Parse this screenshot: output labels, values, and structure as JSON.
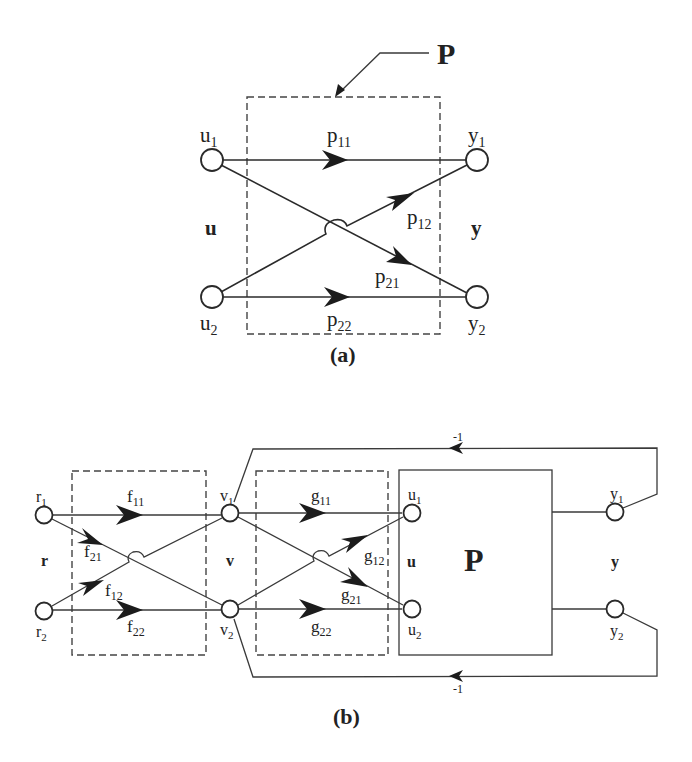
{
  "diagram_a": {
    "caption": "(a)",
    "block_label": "P",
    "inputs": [
      {
        "base": "u",
        "sub": "1"
      },
      {
        "base": "u",
        "sub": "2"
      }
    ],
    "outputs": [
      {
        "base": "y",
        "sub": "1"
      },
      {
        "base": "y",
        "sub": "2"
      }
    ],
    "input_vector": "u",
    "output_vector": "y",
    "branches": [
      {
        "base": "p",
        "sub": "11"
      },
      {
        "base": "p",
        "sub": "12"
      },
      {
        "base": "p",
        "sub": "21"
      },
      {
        "base": "p",
        "sub": "22"
      }
    ]
  },
  "diagram_b": {
    "caption": "(b)",
    "plant_label": "P",
    "reference_nodes": [
      {
        "base": "r",
        "sub": "1"
      },
      {
        "base": "r",
        "sub": "2"
      }
    ],
    "intermediate_nodes": [
      {
        "base": "v",
        "sub": "1"
      },
      {
        "base": "v",
        "sub": "2"
      }
    ],
    "input_nodes": [
      {
        "base": "u",
        "sub": "1"
      },
      {
        "base": "u",
        "sub": "2"
      }
    ],
    "output_nodes": [
      {
        "base": "y",
        "sub": "1"
      },
      {
        "base": "y",
        "sub": "2"
      }
    ],
    "vectors": {
      "r": "r",
      "v": "v",
      "u": "u",
      "y": "y"
    },
    "f_branches": [
      {
        "base": "f",
        "sub": "11"
      },
      {
        "base": "f",
        "sub": "21"
      },
      {
        "base": "f",
        "sub": "12"
      },
      {
        "base": "f",
        "sub": "22"
      }
    ],
    "g_branches": [
      {
        "base": "g",
        "sub": "11"
      },
      {
        "base": "g",
        "sub": "12"
      },
      {
        "base": "g",
        "sub": "21"
      },
      {
        "base": "g",
        "sub": "22"
      }
    ],
    "feedback_gains": {
      "top": "-1",
      "bottom": "-1"
    }
  },
  "colors": {
    "line": "#2a2a2a",
    "background": "#ffffff"
  }
}
